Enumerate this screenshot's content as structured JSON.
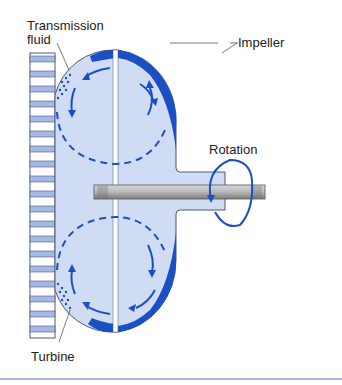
{
  "diagram": {
    "labels": {
      "transmission_fluid_line1": "Transmission",
      "transmission_fluid_line2": "fluid",
      "impeller": "Impeller",
      "rotation": "Rotation",
      "turbine": "Turbine"
    },
    "colors": {
      "housing_fill": "#cfdcf3",
      "housing_stroke": "#4a5a7a",
      "blade_blue": "#1b4fc4",
      "flow_arrow": "#1b4fc4",
      "gear_band_blue": "#a6b8e6",
      "shaft_gray": "#a8a8a8",
      "bottom_rule": "#8a9cc8"
    },
    "components": [
      "ring-gear",
      "impeller",
      "turbine",
      "stator-gap",
      "output-shaft",
      "rotation-arrow",
      "fluid-flow-arrows"
    ]
  }
}
